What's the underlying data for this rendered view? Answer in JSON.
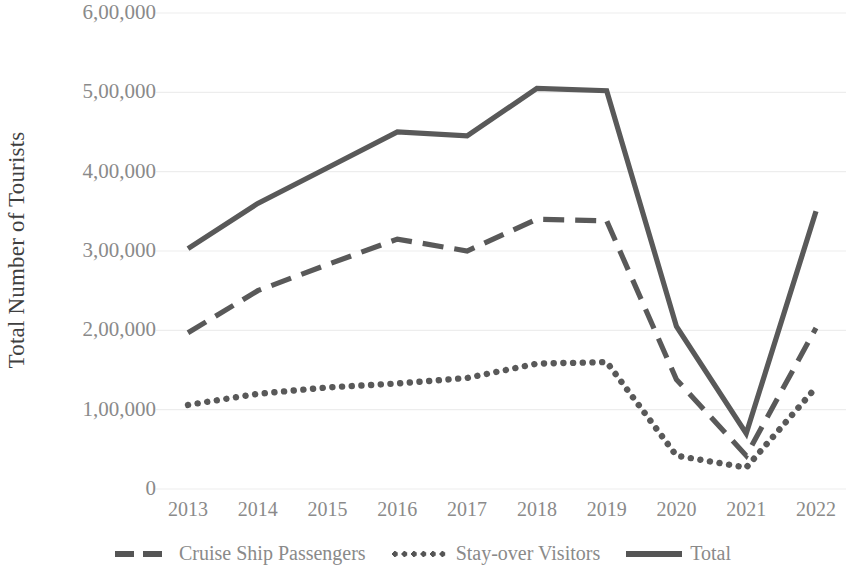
{
  "chart_data": {
    "type": "line",
    "title": "",
    "xlabel": "",
    "ylabel": "Total Number of Tourists",
    "categories": [
      "2013",
      "2014",
      "2015",
      "2016",
      "2017",
      "2018",
      "2019",
      "2020",
      "2021",
      "2022"
    ],
    "ylim": [
      0,
      600000
    ],
    "ytick_labels": [
      "0",
      "1,00,000",
      "2,00,000",
      "3,00,000",
      "4,00,000",
      "5,00,000",
      "6,00,000"
    ],
    "ytick_values": [
      0,
      100000,
      200000,
      300000,
      400000,
      500000,
      600000
    ],
    "grid": true,
    "grid_axis": "y",
    "legend_position": "bottom",
    "series": [
      {
        "name": "Cruise Ship Passengers",
        "style": "dashed",
        "color": "#595959",
        "values": [
          197000,
          250000,
          283000,
          315000,
          300000,
          340000,
          338000,
          138000,
          42000,
          203000
        ]
      },
      {
        "name": "Stay-over Visitors",
        "style": "dotted",
        "color": "#595959",
        "values": [
          106000,
          120000,
          128000,
          133000,
          140000,
          158000,
          160000,
          42000,
          27000,
          128000
        ]
      },
      {
        "name": "Total",
        "style": "solid",
        "color": "#595959",
        "values": [
          303000,
          360000,
          405000,
          450000,
          445000,
          505000,
          502000,
          205000,
          70000,
          350000
        ]
      }
    ]
  },
  "axis": {
    "y_title": "Total Number of Tourists"
  },
  "colors": {
    "line": "#595959",
    "grid": "#ededed",
    "tick_text": "#8a8a8a",
    "axis_title_text": "#3f3f3f",
    "background": "#ffffff"
  }
}
